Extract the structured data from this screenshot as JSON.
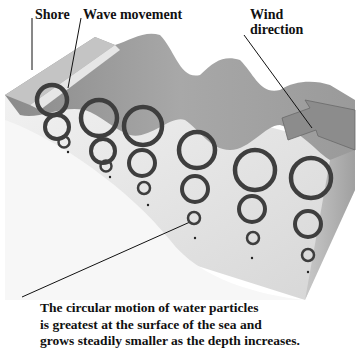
{
  "labels": {
    "shore": "Shore",
    "wave_movement": "Wave movement",
    "wind_line1": "Wind",
    "wind_line2": "direction"
  },
  "caption": {
    "line1": "The circular motion of water particles",
    "line2": "is greatest at the surface of the sea and",
    "line3": "grows steadily smaller as the depth increases."
  },
  "colors": {
    "background": "#ffffff",
    "block_side": "#e4e4e4",
    "water_surface": "#9a9a9a",
    "ring": "#444444",
    "text": "#111111"
  }
}
